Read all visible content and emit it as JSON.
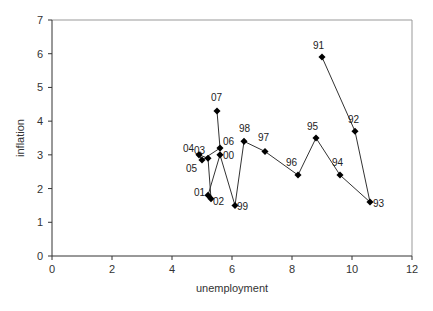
{
  "chart_data": {
    "type": "line",
    "title": "",
    "xlabel": "unemployment",
    "ylabel": "inflation",
    "xlim": [
      0,
      12
    ],
    "ylim": [
      0,
      7
    ],
    "xticks": [
      0,
      2,
      4,
      6,
      8,
      10,
      12
    ],
    "yticks": [
      0,
      1,
      2,
      3,
      4,
      5,
      6,
      7
    ],
    "grid": false,
    "legend": null,
    "series": [
      {
        "name": "inflation vs unemployment (connected, by year)",
        "points": [
          {
            "label": "91",
            "x": 9.0,
            "y": 5.9
          },
          {
            "label": "92",
            "x": 10.1,
            "y": 3.7
          },
          {
            "label": "93",
            "x": 10.6,
            "y": 1.6
          },
          {
            "label": "94",
            "x": 9.6,
            "y": 2.4
          },
          {
            "label": "95",
            "x": 8.8,
            "y": 3.5
          },
          {
            "label": "96",
            "x": 8.2,
            "y": 2.4
          },
          {
            "label": "97",
            "x": 7.1,
            "y": 3.1
          },
          {
            "label": "98",
            "x": 6.4,
            "y": 3.4
          },
          {
            "label": "99",
            "x": 6.1,
            "y": 1.5
          },
          {
            "label": "00",
            "x": 5.6,
            "y": 3.0
          },
          {
            "label": "01",
            "x": 5.2,
            "y": 1.8
          },
          {
            "label": "02",
            "x": 5.3,
            "y": 1.7
          },
          {
            "label": "03",
            "x": 5.2,
            "y": 2.9
          },
          {
            "label": "04",
            "x": 4.9,
            "y": 3.0
          },
          {
            "label": "05",
            "x": 5.0,
            "y": 2.85
          },
          {
            "label": "06",
            "x": 5.6,
            "y": 3.2
          },
          {
            "label": "07",
            "x": 5.5,
            "y": 4.3
          }
        ]
      }
    ]
  },
  "colors": {
    "line": "#333333",
    "marker": "#000000",
    "axis": "#333333",
    "frame": "#999999"
  }
}
